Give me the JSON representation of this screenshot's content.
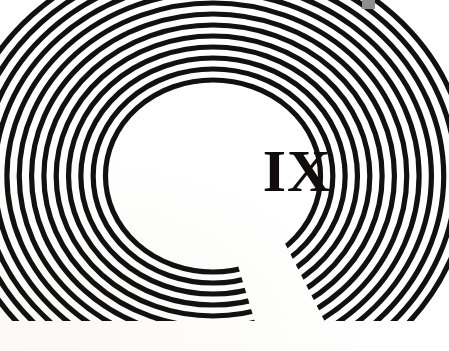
{
  "page": {
    "kind": "book-part-divider",
    "width": 449,
    "height": 351,
    "background_color": "#ffffff",
    "ink_color": "#111111",
    "paper_tint": "#f6f4f0"
  },
  "numeral": {
    "text": "IX",
    "value": 9,
    "color": "#100d0c",
    "center_x": 297,
    "center_y": 174
  },
  "ornament": {
    "name": "concentric-arc-omega",
    "description": "Nested concentric arcs forming an omega / horseshoe that bleeds off the top, left and right edges and is cut flat along a baseline near the foot of the page.",
    "stroke_color": "#111111",
    "gap_color": "#ffffff",
    "center_x": 213,
    "center_y": 176,
    "ring_count": 13,
    "innermost_radius": 96,
    "ring_pitch": 11,
    "stroke_width": 5.2,
    "baseline_y": 321,
    "mouth_gap_left_x": 255,
    "mouth_gap_right_x": 325,
    "x_scale": 1.12,
    "y_scale": 1.0
  },
  "artifact": {
    "name": "scan-artifact",
    "color": "#8e8e8e",
    "x": 362,
    "y": 0,
    "width": 13,
    "height": 9
  },
  "margins": {
    "bottom_white_band_top_y": 321
  }
}
